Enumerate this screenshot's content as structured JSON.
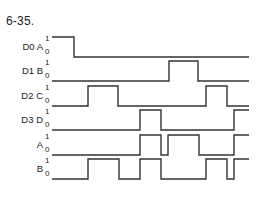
{
  "figure": {
    "title": "6-35.",
    "x_start": 52,
    "x_end": 249,
    "amplitude": 20,
    "level_labels": {
      "high": "1",
      "low": "0"
    }
  },
  "signals": [
    {
      "label": "D0 A",
      "baseline_y": 57,
      "init": 1,
      "transitions": [
        74
      ]
    },
    {
      "label": "D1 B",
      "baseline_y": 81,
      "init": 0,
      "transitions": [
        169,
        198
      ]
    },
    {
      "label": "D2 C",
      "baseline_y": 106,
      "init": 0,
      "transitions": [
        88,
        118,
        206,
        227
      ]
    },
    {
      "label": "D3 D",
      "baseline_y": 130,
      "init": 0,
      "transitions": [
        140,
        161,
        234
      ]
    },
    {
      "label": "A",
      "baseline_y": 155,
      "init": 0,
      "transitions": [
        140,
        161,
        168,
        199,
        234
      ]
    },
    {
      "label": "B",
      "baseline_y": 179,
      "init": 0,
      "transitions": [
        88,
        119,
        140,
        161,
        206,
        227,
        234
      ]
    }
  ]
}
